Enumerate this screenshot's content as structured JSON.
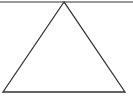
{
  "diagram": {
    "shape": "triangle",
    "stroke_color": "#333333",
    "top_line_color": "#777777",
    "top_line": {
      "x1": 0,
      "y1": 2,
      "x2": 133,
      "y2": 2
    },
    "triangle_points": "64,2 3,92 125,92"
  }
}
